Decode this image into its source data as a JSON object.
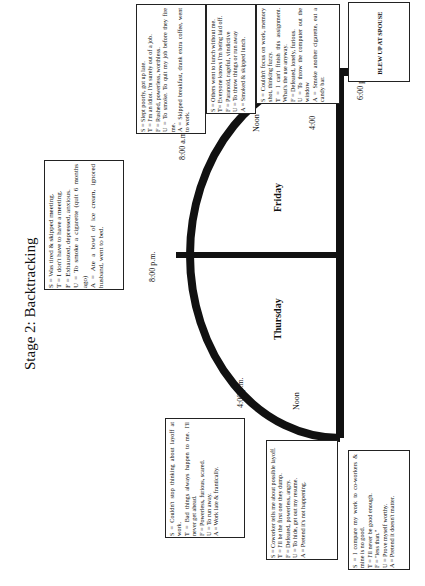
{
  "title": "Stage 2: Backtracking",
  "days": {
    "left": "Thursday",
    "right": "Friday"
  },
  "times": {
    "t1": "10: a.m.",
    "t2": "4:00 p.m.",
    "t3": "8:00 p.m.",
    "t4": "8:00 a.m.",
    "t5": "Noon",
    "t6": "4:00",
    "t7": "6:00 p.m.",
    "thu_noon": "Noon"
  },
  "boxes": {
    "b1": [
      "S = Slept poorly, got up late.",
      "T = I'm an idiot. I'm surely out of a job.",
      "F = Rushed, powerless, worthless.",
      "U = To smoke. To quit my job before they fire me.",
      "A = Skipped breakfast, drank extra coffee, went to work."
    ],
    "b2": [
      "S = Was tired & skipped meeting.",
      "T = I don't have to have a meeting.",
      "F = Exhausted, depressed, anxious.",
      "U = To smoke a cigarette (quit 6 months ago)",
      "A = Ate a bowl of ice cream, ignored husband, went to bed."
    ],
    "b3": [
      "S = Others went to lunch without me.",
      "T= Everyone knows I'm being laid off.",
      "F = Paranoid, rageful, vindictive",
      "U = To throw things or run away",
      "A = Smoked & skipped lunch."
    ],
    "b4": [
      "S = Couldn't focus on work, memory shot, thinking fuzzy.",
      "T = I can't finish this assignment. What's the use anyway.",
      "F = Defeated, lonely, furious.",
      "U = To throw the computer out the window",
      "A = Smoke another cigarette, eat a candy bar."
    ],
    "b5": [
      "S = Couldn't stop thinking about layoff at work.",
      "T = Bad things always happen to me. I'll never get ahead.",
      "F = Powerless, furious, scared.",
      "U = To run away.",
      "A = Work late & frantically."
    ],
    "b6": [
      "S = Coworker tells me about possible layoff.",
      "T = I'll be the first one they dump.",
      "F = Defeated, powerless, angry.",
      "U = To hide, get out my resume.",
      "A = Pretend it's not happening."
    ],
    "b7": [
      "S = I compare my work to co-workers & mine is no good.",
      "T = I'll never be good enough.",
      "F = \"less than.\"",
      "U = Prove myself worthy.",
      "A = Pretend it doesn't matter."
    ],
    "event": "BLEW UP AT SPOUSE"
  }
}
